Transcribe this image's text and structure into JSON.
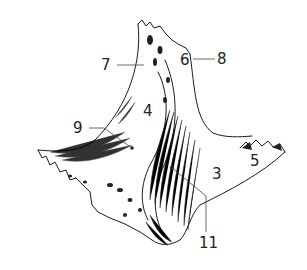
{
  "figure": {
    "ink_color": "#1a1a1a",
    "background": "#ffffff",
    "labels": [
      {
        "id": "label-7",
        "text": "7",
        "x": 101,
        "y": 58
      },
      {
        "id": "label-6",
        "text": "6",
        "x": 180,
        "y": 53
      },
      {
        "id": "label-8",
        "text": "8",
        "x": 217,
        "y": 52
      },
      {
        "id": "label-4",
        "text": "4",
        "x": 143,
        "y": 104
      },
      {
        "id": "label-9",
        "text": "9",
        "x": 73,
        "y": 121
      },
      {
        "id": "label-5",
        "text": "5",
        "x": 250,
        "y": 154
      },
      {
        "id": "label-3",
        "text": "3",
        "x": 212,
        "y": 167
      },
      {
        "id": "label-11",
        "text": "11",
        "x": 199,
        "y": 236
      }
    ]
  }
}
